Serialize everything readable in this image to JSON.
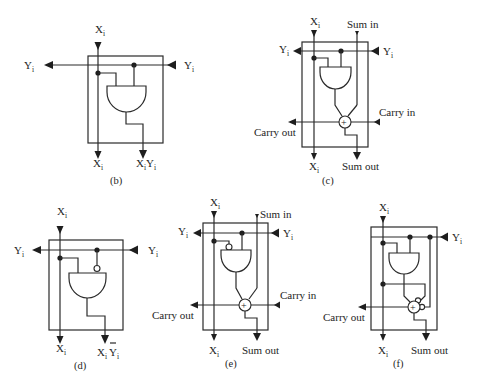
{
  "figure": {
    "panels": [
      {
        "id": "b",
        "caption": "(b)",
        "inputs": {
          "x_top": "X",
          "y_right": "Y"
        },
        "outputs": {
          "x_bottom": "X",
          "y_left": "Y",
          "result": "XY"
        },
        "gate": "AND",
        "inverted_input": "none"
      },
      {
        "id": "c",
        "caption": "(c)",
        "inputs": {
          "x_top": "X",
          "y_right": "Y",
          "sum_in": "Sum in",
          "carry_in": "Carry in"
        },
        "outputs": {
          "x_bottom": "X",
          "y_left": "Y",
          "sum_out": "Sum out",
          "carry_out": "Carry out"
        },
        "gate": "AND + full adder",
        "inverted_input": "none"
      },
      {
        "id": "d",
        "caption": "(d)",
        "inputs": {
          "x_top": "X",
          "y_right": "Y"
        },
        "outputs": {
          "x_bottom": "X",
          "y_left": "Y",
          "result": "XȲ"
        },
        "gate": "AND",
        "inverted_input": "Y"
      },
      {
        "id": "e",
        "caption": "(e)",
        "inputs": {
          "x_top": "X",
          "y_right": "Y",
          "sum_in": "Sum in",
          "carry_in": "Carry in"
        },
        "outputs": {
          "x_bottom": "X",
          "y_left": "Y",
          "sum_out": "Sum out",
          "carry_out": "Carry out"
        },
        "gate": "AND + full adder",
        "inverted_input": "X"
      },
      {
        "id": "f",
        "caption": "(f)",
        "inputs": {
          "x_top": "X",
          "y_right": "Y"
        },
        "outputs": {
          "x_bottom": "X",
          "sum_out": "Sum out",
          "carry_out": "Carry out"
        },
        "gate": "AND + full adder (inverted sum/carry inputs)",
        "inverted_input": "adder inputs"
      }
    ],
    "labels": {
      "x": "X",
      "y": "Y",
      "sub_i": "i",
      "sum_in": "Sum in",
      "sum_out": "Sum out",
      "carry_in": "Carry in",
      "carry_out": "Carry out",
      "xy": "X",
      "xy_y": "Y",
      "plus": "+"
    },
    "captions": {
      "b": "(b)",
      "c": "(c)",
      "d": "(d)",
      "e": "(e)",
      "f": "(f)"
    }
  }
}
